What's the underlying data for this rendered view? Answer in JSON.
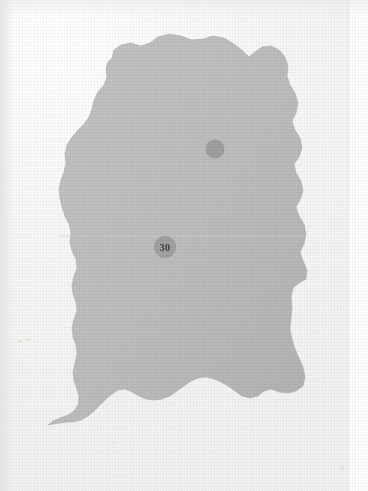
{
  "figure": {
    "kind": "scanned-map-plate",
    "background_color": "#f6f6f4",
    "page_edge_color": "#ffffff"
  },
  "map": {
    "region_name": "shaded-region",
    "fill_color": "#bdbdbd",
    "fill_color_shadow": "#b4b4b4",
    "outline_color": "#b0b0b0",
    "crease_line_color": "#cfcfcd",
    "outline_path": "M 112,58 L 114,50 L 121,45 L 131,43 L 141,46 L 150,43 L 158,37 L 169,34 L 181,36 L 192,40 L 203,39 L 213,36 L 224,38 L 234,44 L 243,51 L 249,57 L 255,52 L 262,47 L 271,46 L 279,50 L 285,57 L 288,66 L 287,76 L 290,85 L 295,93 L 298,103 L 296,113 L 292,121 L 295,130 L 300,138 L 302,148 L 299,157 L 294,164 L 296,173 L 301,181 L 303,191 L 300,200 L 296,207 L 299,216 L 304,224 L 306,234 L 304,244 L 300,252 L 303,261 L 307,270 L 306,279 L 299,283 L 293,288 L 291,297 L 292,307 L 291,318 L 290,329 L 292,339 L 295,349 L 299,358 L 303,367 L 305,377 L 303,386 L 296,391 L 288,393 L 279,392 L 271,389 L 264,391 L 258,396 L 250,398 L 242,396 L 235,391 L 228,386 L 221,382 L 214,379 L 206,377 L 198,378 L 191,381 L 184,386 L 177,391 L 170,396 L 162,399 L 154,400 L 146,399 L 139,396 L 132,392 L 125,389 L 118,390 L 112,394 L 106,399 L 100,405 L 94,411 L 88,416 L 81,420 L 74,422 L 67,422 L 60,423 L 53,424 L 48,425 L 53,421 L 60,418 L 68,415 L 74,411 L 78,405 L 79,397 L 77,389 L 74,381 L 73,372 L 75,363 L 77,354 L 76,345 L 73,337 L 72,328 L 74,319 L 77,311 L 76,302 L 73,294 L 72,285 L 74,276 L 77,268 L 76,259 L 72,251 L 70,242 L 71,233 L 69,224 L 65,216 L 62,207 L 60,198 L 59,189 L 61,180 L 64,172 L 66,163 L 65,154 L 67,145 L 72,137 L 78,130 L 84,124 L 89,117 L 92,109 L 94,100 L 98,92 L 104,85 L 107,77 L 106,68 L 108,62 Z",
    "crease_y": 236
  },
  "markers": [
    {
      "name": "plain-dot-marker",
      "label": "",
      "cx": 215,
      "cy": 149,
      "r": 9.5,
      "fill": "#9e9e9e"
    },
    {
      "name": "numbered-marker-30",
      "label": "30",
      "cx": 165,
      "cy": 247,
      "r": 11,
      "fill": "#a0a0a0",
      "text_color": "#3c3c3c"
    }
  ],
  "artifacts": {
    "specks": [
      {
        "x": 18,
        "y": 340,
        "w": 4,
        "h": 3
      },
      {
        "x": 27,
        "y": 338,
        "w": 3,
        "h": 3
      },
      {
        "x": 36,
        "y": 341,
        "w": 3,
        "h": 2
      },
      {
        "x": 113,
        "y": 441,
        "w": 3,
        "h": 2
      },
      {
        "x": 340,
        "y": 466,
        "w": 4,
        "h": 4
      }
    ]
  }
}
